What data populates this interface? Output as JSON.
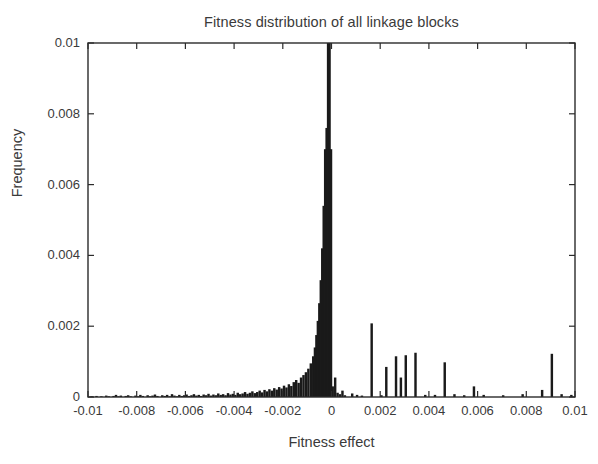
{
  "chart_data": {
    "type": "bar",
    "title": "Fitness distribution of all linkage blocks",
    "xlabel": "Fitness effect",
    "ylabel": "Frequency",
    "xlim": [
      -0.01,
      0.01
    ],
    "ylim": [
      0,
      0.01
    ],
    "grid": false,
    "legend": null,
    "bar_color": "#1a1a1a",
    "axis_color": "#2b2b2b",
    "background": "#ffffff",
    "xticks": [
      -0.01,
      -0.008,
      -0.006,
      -0.004,
      -0.002,
      0,
      0.002,
      0.004,
      0.006,
      0.008,
      0.01
    ],
    "xtick_labels": [
      "-0.01",
      "-0.008",
      "-0.006",
      "-0.004",
      "-0.002",
      "0",
      "0.002",
      "0.004",
      "0.006",
      "0.008",
      "0.01"
    ],
    "yticks": [
      0,
      0.002,
      0.004,
      0.006,
      0.008,
      0.01
    ],
    "ytick_labels": [
      "0",
      "0.002",
      "0.004",
      "0.006",
      "0.008",
      "0.01"
    ],
    "bin_width": 0.0001,
    "note": "Central peak at slightly negative fitness effect is clipped at ylim top (0.01).",
    "bins": [
      {
        "x": -0.00995,
        "y": 0.0
      },
      {
        "x": -0.00985,
        "y": 2e-05
      },
      {
        "x": -0.00975,
        "y": 0.0
      },
      {
        "x": -0.00965,
        "y": 3e-05
      },
      {
        "x": -0.00955,
        "y": 0.0
      },
      {
        "x": -0.00945,
        "y": 2e-05
      },
      {
        "x": -0.00935,
        "y": 0.0
      },
      {
        "x": -0.00925,
        "y": 4e-05
      },
      {
        "x": -0.00915,
        "y": 2e-05
      },
      {
        "x": -0.00905,
        "y": 0.0
      },
      {
        "x": -0.00895,
        "y": 3e-05
      },
      {
        "x": -0.00885,
        "y": 6e-05
      },
      {
        "x": -0.00875,
        "y": 2e-05
      },
      {
        "x": -0.00865,
        "y": 4e-05
      },
      {
        "x": -0.00855,
        "y": 0.0
      },
      {
        "x": -0.00845,
        "y": 3e-05
      },
      {
        "x": -0.00835,
        "y": 5e-05
      },
      {
        "x": -0.00825,
        "y": 2e-05
      },
      {
        "x": -0.00815,
        "y": 0.0
      },
      {
        "x": -0.00805,
        "y": 4e-05
      },
      {
        "x": -0.00795,
        "y": 2e-05
      },
      {
        "x": -0.00785,
        "y": 6e-05
      },
      {
        "x": -0.00775,
        "y": 3e-05
      },
      {
        "x": -0.00765,
        "y": 0.0
      },
      {
        "x": -0.00755,
        "y": 5e-05
      },
      {
        "x": -0.00745,
        "y": 2e-05
      },
      {
        "x": -0.00735,
        "y": 4e-05
      },
      {
        "x": -0.00725,
        "y": 7e-05
      },
      {
        "x": -0.00715,
        "y": 3e-05
      },
      {
        "x": -0.00705,
        "y": 0.0
      },
      {
        "x": -0.00695,
        "y": 5e-05
      },
      {
        "x": -0.00685,
        "y": 3e-05
      },
      {
        "x": -0.00675,
        "y": 6e-05
      },
      {
        "x": -0.00665,
        "y": 2e-05
      },
      {
        "x": -0.00655,
        "y": 8e-05
      },
      {
        "x": -0.00645,
        "y": 4e-05
      },
      {
        "x": -0.00635,
        "y": 2e-05
      },
      {
        "x": -0.00625,
        "y": 6e-05
      },
      {
        "x": -0.00615,
        "y": 3e-05
      },
      {
        "x": -0.00605,
        "y": 5e-05
      },
      {
        "x": -0.00595,
        "y": 7e-05
      },
      {
        "x": -0.00585,
        "y": 3e-05
      },
      {
        "x": -0.00575,
        "y": 5e-05
      },
      {
        "x": -0.00565,
        "y": 8e-05
      },
      {
        "x": -0.00555,
        "y": 4e-05
      },
      {
        "x": -0.00545,
        "y": 6e-05
      },
      {
        "x": -0.00535,
        "y": 3e-05
      },
      {
        "x": -0.00525,
        "y": 7e-05
      },
      {
        "x": -0.00515,
        "y": 5e-05
      },
      {
        "x": -0.00505,
        "y": 9e-05
      },
      {
        "x": -0.00495,
        "y": 4e-05
      },
      {
        "x": -0.00485,
        "y": 7e-05
      },
      {
        "x": -0.00475,
        "y": 5e-05
      },
      {
        "x": -0.00465,
        "y": 0.0001
      },
      {
        "x": -0.00455,
        "y": 6e-05
      },
      {
        "x": -0.00445,
        "y": 8e-05
      },
      {
        "x": -0.00435,
        "y": 5e-05
      },
      {
        "x": -0.00425,
        "y": 0.00011
      },
      {
        "x": -0.00415,
        "y": 7e-05
      },
      {
        "x": -0.00405,
        "y": 9e-05
      },
      {
        "x": -0.00395,
        "y": 6e-05
      },
      {
        "x": -0.00385,
        "y": 0.00012
      },
      {
        "x": -0.00375,
        "y": 8e-05
      },
      {
        "x": -0.00365,
        "y": 0.0001
      },
      {
        "x": -0.00355,
        "y": 0.00014
      },
      {
        "x": -0.00345,
        "y": 9e-05
      },
      {
        "x": -0.00335,
        "y": 0.00012
      },
      {
        "x": -0.00325,
        "y": 0.00016
      },
      {
        "x": -0.00315,
        "y": 0.00011
      },
      {
        "x": -0.00305,
        "y": 0.00014
      },
      {
        "x": -0.00295,
        "y": 0.00018
      },
      {
        "x": -0.00285,
        "y": 0.00013
      },
      {
        "x": -0.00275,
        "y": 0.0002
      },
      {
        "x": -0.00265,
        "y": 0.00016
      },
      {
        "x": -0.00255,
        "y": 0.00022
      },
      {
        "x": -0.00245,
        "y": 0.00018
      },
      {
        "x": -0.00235,
        "y": 0.00025
      },
      {
        "x": -0.00225,
        "y": 0.00021
      },
      {
        "x": -0.00215,
        "y": 0.00028
      },
      {
        "x": -0.00205,
        "y": 0.00024
      },
      {
        "x": -0.00195,
        "y": 0.00032
      },
      {
        "x": -0.00185,
        "y": 0.00027
      },
      {
        "x": -0.00175,
        "y": 0.00036
      },
      {
        "x": -0.00165,
        "y": 0.00031
      },
      {
        "x": -0.00155,
        "y": 0.00042
      },
      {
        "x": -0.00145,
        "y": 0.00048
      },
      {
        "x": -0.00135,
        "y": 0.0004
      },
      {
        "x": -0.00125,
        "y": 0.00055
      },
      {
        "x": -0.00115,
        "y": 0.00062
      },
      {
        "x": -0.00105,
        "y": 0.0007
      },
      {
        "x": -0.00095,
        "y": 0.0008
      },
      {
        "x": -0.00085,
        "y": 0.00095
      },
      {
        "x": -0.00075,
        "y": 0.00115
      },
      {
        "x": -0.00068,
        "y": 0.0014
      },
      {
        "x": -0.00062,
        "y": 0.00175
      },
      {
        "x": -0.00056,
        "y": 0.00215
      },
      {
        "x": -0.0005,
        "y": 0.00265
      },
      {
        "x": -0.00044,
        "y": 0.0033
      },
      {
        "x": -0.00038,
        "y": 0.0042
      },
      {
        "x": -0.00032,
        "y": 0.0054
      },
      {
        "x": -0.00026,
        "y": 0.007
      },
      {
        "x": -0.0002,
        "y": 0.0076
      },
      {
        "x": -0.00014,
        "y": 0.01
      },
      {
        "x": -8e-05,
        "y": 0.01
      },
      {
        "x": -2e-05,
        "y": 0.007
      },
      {
        "x": 5e-05,
        "y": 0.0003
      },
      {
        "x": 0.00015,
        "y": 0.00055
      },
      {
        "x": 0.00025,
        "y": 0.00012
      },
      {
        "x": 0.00035,
        "y": 8e-05
      },
      {
        "x": 0.00045,
        "y": 0.00018
      },
      {
        "x": 0.00055,
        "y": 5e-05
      },
      {
        "x": 0.00085,
        "y": 0.0001
      },
      {
        "x": 0.00105,
        "y": 6e-05
      },
      {
        "x": 0.00125,
        "y": 4e-05
      },
      {
        "x": 0.00165,
        "y": 0.00208
      },
      {
        "x": 0.00205,
        "y": 5e-05
      },
      {
        "x": 0.00225,
        "y": 0.00085
      },
      {
        "x": 0.00265,
        "y": 0.00115
      },
      {
        "x": 0.00285,
        "y": 0.00055
      },
      {
        "x": 0.00305,
        "y": 0.00118
      },
      {
        "x": 0.00345,
        "y": 0.00125
      },
      {
        "x": 0.00385,
        "y": 6e-05
      },
      {
        "x": 0.00425,
        "y": 6e-05
      },
      {
        "x": 0.00465,
        "y": 0.00098
      },
      {
        "x": 0.00505,
        "y": 8e-05
      },
      {
        "x": 0.00545,
        "y": 5e-05
      },
      {
        "x": 0.00585,
        "y": 0.0003
      },
      {
        "x": 0.00625,
        "y": 6e-05
      },
      {
        "x": 0.00705,
        "y": 5e-05
      },
      {
        "x": 0.00785,
        "y": 8e-05
      },
      {
        "x": 0.00865,
        "y": 0.0002
      },
      {
        "x": 0.00905,
        "y": 0.00122
      },
      {
        "x": 0.00945,
        "y": 8e-05
      },
      {
        "x": 0.00985,
        "y": 6e-05
      }
    ]
  }
}
